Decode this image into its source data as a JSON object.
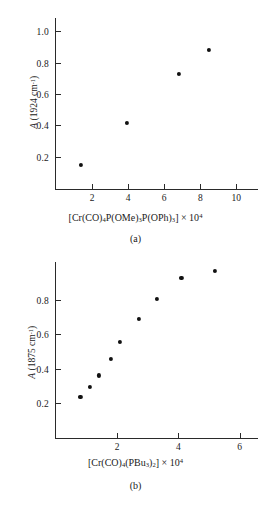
{
  "figure": {
    "panels": [
      {
        "key": "a",
        "caption": "(a)",
        "ylabel_prefix": "A",
        "ylabel_rest": " (1924 cm",
        "ylabel_sup": "-1",
        "ylabel_close": ")",
        "ylabel_plain": "A (1924 cm⁻¹)",
        "xlabel_plain": "[Cr(CO)₄P(OMe)₃P(OPh)₃] × 10⁴"
      },
      {
        "key": "b",
        "caption": "(b)",
        "ylabel_prefix": "A",
        "ylabel_rest": " (1875 cm",
        "ylabel_sup": "-1",
        "ylabel_close": ")",
        "ylabel_plain": "A (1875 cm⁻¹)",
        "xlabel_plain": "[Cr(CO)₄(PBu₃)₂] × 10⁴"
      }
    ],
    "marker_color": "#111111",
    "axis_color": "#2a2a2a",
    "background": "#ffffff"
  },
  "chart_data": [
    {
      "type": "scatter",
      "panel": "a",
      "title": "(a)",
      "xlabel": "[Cr(CO)4P(OMe)3P(OPh)3] × 10^4",
      "ylabel": "A (1924 cm^-1)",
      "xlim": [
        0,
        11.2
      ],
      "ylim": [
        0,
        1.09
      ],
      "xticks": [
        2,
        4,
        6,
        8,
        10
      ],
      "yticks": [
        0.2,
        0.4,
        0.6,
        0.8,
        1.0
      ],
      "xticklabels": [
        "2",
        "4",
        "6",
        "8",
        "10"
      ],
      "yticklabels": [
        "0.2",
        "0.4",
        "0.6",
        "0.8",
        "1.0"
      ],
      "grid": false,
      "legend": false,
      "points": [
        {
          "x": 1.4,
          "y": 0.15
        },
        {
          "x": 3.95,
          "y": 0.42
        },
        {
          "x": 6.8,
          "y": 0.735
        },
        {
          "x": 8.5,
          "y": 0.885
        }
      ]
    },
    {
      "type": "scatter",
      "panel": "b",
      "title": "(b)",
      "xlabel": "[Cr(CO)4(PBu3)2] × 10^4",
      "ylabel": "A (1875 cm^-1)",
      "xlim": [
        0,
        6.6
      ],
      "ylim": [
        0,
        1.03
      ],
      "xticks": [
        2,
        4,
        6
      ],
      "yticks": [
        0.2,
        0.4,
        0.6,
        0.8
      ],
      "xticklabels": [
        "2",
        "4",
        "6"
      ],
      "yticklabels": [
        "0.2",
        "0.4",
        "0.6",
        "0.8"
      ],
      "grid": false,
      "legend": false,
      "points": [
        {
          "x": 0.8,
          "y": 0.24
        },
        {
          "x": 1.1,
          "y": 0.3
        },
        {
          "x": 1.4,
          "y": 0.365
        },
        {
          "x": 1.8,
          "y": 0.46
        },
        {
          "x": 2.1,
          "y": 0.56
        },
        {
          "x": 2.7,
          "y": 0.695
        },
        {
          "x": 3.3,
          "y": 0.815
        },
        {
          "x": 4.1,
          "y": 0.935
        },
        {
          "x": 5.2,
          "y": 0.975
        }
      ]
    }
  ]
}
